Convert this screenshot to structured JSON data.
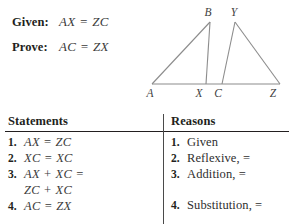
{
  "problem": {
    "given_label": "Given:",
    "given_value": "AX = ZC",
    "prove_label": "Prove:",
    "prove_value": "AC = ZX"
  },
  "diagram": {
    "vertices": [
      {
        "name": "A",
        "label": "A",
        "x": 10,
        "y": 88
      },
      {
        "name": "B",
        "label": "B",
        "x": 68,
        "y": 16
      },
      {
        "name": "X",
        "label": "X",
        "x": 58,
        "y": 88
      },
      {
        "name": "C",
        "label": "C",
        "x": 76,
        "y": 88
      },
      {
        "name": "Y",
        "label": "Y",
        "x": 93,
        "y": 16
      },
      {
        "name": "Z",
        "label": "Z",
        "x": 133,
        "y": 88
      }
    ],
    "line_color": "#8c8c8c",
    "triangles": [
      "A-B-X",
      "C-Y-Z"
    ],
    "baseline": "A-X-C-Z"
  },
  "table": {
    "statements_header": "Statements",
    "reasons_header": "Reasons",
    "statements": [
      {
        "num": "1.",
        "text": "AX = ZC"
      },
      {
        "num": "2.",
        "text": "XC = XC"
      },
      {
        "num": "3.",
        "text": "AX + XC =",
        "cont": "ZC + XC"
      },
      {
        "num": "4.",
        "text": "AC = ZX"
      }
    ],
    "reasons": [
      {
        "num": "1.",
        "text": "Given"
      },
      {
        "num": "2.",
        "text": "Reflexive, ="
      },
      {
        "num": "3.",
        "text": "Addition, ="
      },
      {
        "num": "4.",
        "text": "Substitution, ="
      }
    ]
  }
}
